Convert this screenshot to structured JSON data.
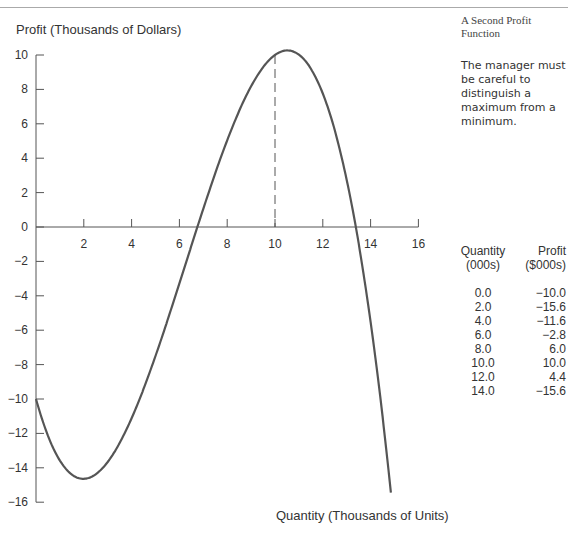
{
  "side_panel": {
    "title": "A Second Profit Function",
    "note": "The manager must be careful to distinguish a maximum from a minimum."
  },
  "table": {
    "headers": [
      [
        "Quantity",
        "(000s)"
      ],
      [
        "Profit",
        "($000s)"
      ]
    ],
    "rows": [
      [
        "0.0",
        "−10.0"
      ],
      [
        "2.0",
        "−15.6"
      ],
      [
        "4.0",
        "−11.6"
      ],
      [
        "6.0",
        "−2.8"
      ],
      [
        "8.0",
        "6.0"
      ],
      [
        "10.0",
        "10.0"
      ],
      [
        "12.0",
        "4.4"
      ],
      [
        "14.0",
        "−15.6"
      ]
    ]
  },
  "chart_data": {
    "type": "line",
    "title": "A Second Profit Function",
    "xlabel": "Quantity (Thousands of Units)",
    "ylabel": "Profit (Thousands of Dollars)",
    "xlim": [
      0,
      16
    ],
    "ylim": [
      -16,
      10
    ],
    "xticks": [
      2,
      4,
      6,
      8,
      10,
      12,
      14,
      16
    ],
    "yticks": [
      10,
      8,
      6,
      4,
      2,
      0,
      -2,
      -4,
      -6,
      -8,
      -10,
      -12,
      -14,
      -16
    ],
    "grid": false,
    "series": [
      {
        "name": "Profit",
        "x": [
          0,
          2,
          4,
          6,
          8,
          10,
          12,
          14
        ],
        "y": [
          -10.0,
          -15.6,
          -11.6,
          -2.8,
          6.0,
          10.0,
          4.4,
          -15.6
        ]
      }
    ],
    "annotations": [
      {
        "type": "dashed-vertical",
        "x": 10,
        "from_y": 0,
        "to_y": 10
      }
    ]
  }
}
